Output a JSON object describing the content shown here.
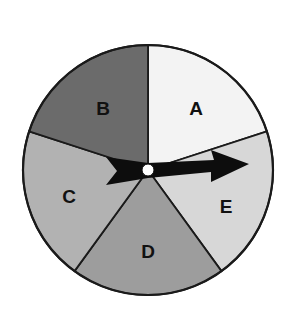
{
  "diagram": {
    "type": "spinner",
    "center": [
      148,
      170
    ],
    "radius": 125,
    "outline_color": "#1a1a1a",
    "sectors": [
      {
        "label": "A",
        "start_angle": -90,
        "end_angle": -18,
        "color": "#f3f3f3",
        "label_pos": [
          196,
          115
        ]
      },
      {
        "label": "E",
        "start_angle": -18,
        "end_angle": 54,
        "color": "#d7d7d7",
        "label_pos": [
          226,
          213
        ]
      },
      {
        "label": "D",
        "start_angle": 54,
        "end_angle": 126,
        "color": "#9d9d9d",
        "label_pos": [
          148,
          258
        ]
      },
      {
        "label": "C",
        "start_angle": 126,
        "end_angle": 198,
        "color": "#b2b2b2",
        "label_pos": [
          69,
          203
        ]
      },
      {
        "label": "B",
        "start_angle": 198,
        "end_angle": 270,
        "color": "#6b6b6b",
        "label_pos": [
          103,
          115
        ]
      }
    ],
    "arrow": {
      "color": "#0d0d0d",
      "points": "106,157 117,171 106,185 148,178 211,172 211,182 249,164 211,150 214,160 148,163",
      "pointing_to": "E"
    },
    "hub": {
      "color": "#ffffff",
      "radius": 6
    }
  }
}
